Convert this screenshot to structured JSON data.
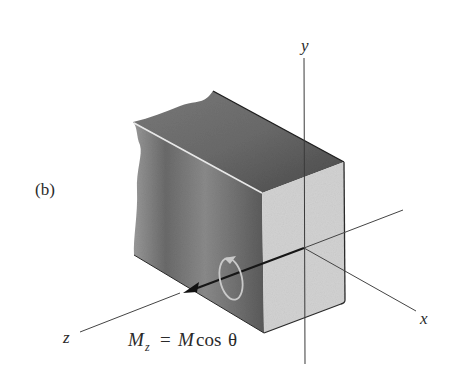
{
  "figure": {
    "panel_label": "(b)",
    "axes": {
      "x_label": "x",
      "y_label": "y",
      "z_label": "z"
    },
    "moment_label": {
      "lhs_symbol": "M",
      "lhs_subscript": "z",
      "equals": "=",
      "rhs_symbol": "M",
      "rhs_function": "cos",
      "rhs_angle": "θ"
    },
    "colors": {
      "background": "#ffffff",
      "front_face": "#d4d4d4",
      "top_face": "#5e5e5e",
      "side_face": "#6e6e6e",
      "axis_line": "#444444",
      "moment_vector": "#1a1a1a",
      "rotation_arrow": "#c8c8c8"
    }
  }
}
